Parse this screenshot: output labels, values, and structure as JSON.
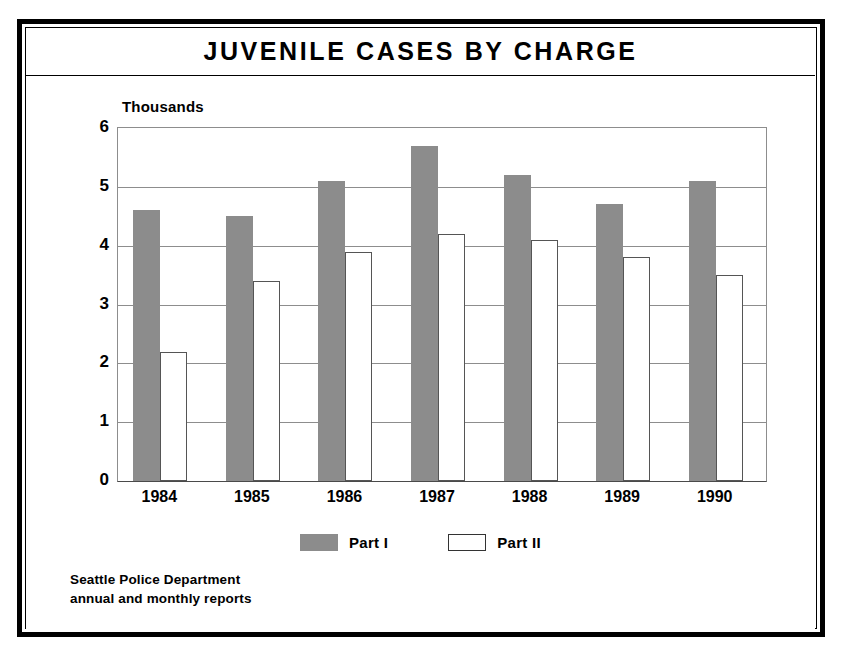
{
  "figure": {
    "title": "JUVENILE CASES BY CHARGE",
    "source_line1": "Seattle Police Department",
    "source_line2": "annual and monthly reports"
  },
  "chart_data": {
    "type": "bar",
    "title": "JUVENILE CASES BY CHARGE",
    "subtitle": "",
    "xlabel": "",
    "ylabel": "Thousands",
    "unit_label": "Thousands",
    "categories": [
      "1984",
      "1985",
      "1986",
      "1987",
      "1988",
      "1989",
      "1990"
    ],
    "series": [
      {
        "name": "Part I",
        "color": "#8c8c8c",
        "values": [
          4.6,
          4.5,
          5.1,
          5.7,
          5.2,
          4.7,
          5.1
        ]
      },
      {
        "name": "Part II",
        "color": "#ffffff",
        "values": [
          2.2,
          3.4,
          3.9,
          4.2,
          4.1,
          3.8,
          3.5
        ]
      }
    ],
    "ylim": [
      0,
      6
    ],
    "yticks": [
      0,
      1,
      2,
      3,
      4,
      5,
      6
    ],
    "ytick_labels": [
      "0",
      "1",
      "2",
      "3",
      "4",
      "5",
      "6"
    ],
    "grid": true,
    "grid_axis": "y",
    "legend_position": "bottom-center",
    "source": "Seattle Police Department annual and monthly reports"
  },
  "legend": {
    "items": [
      {
        "label": "Part I",
        "swatch": "filled-gray"
      },
      {
        "label": "Part II",
        "swatch": "outline-white"
      }
    ]
  },
  "colors": {
    "part1_fill": "#8c8c8c",
    "part2_fill": "#ffffff",
    "frame": "#000000",
    "gridline": "#8d8d8d"
  }
}
